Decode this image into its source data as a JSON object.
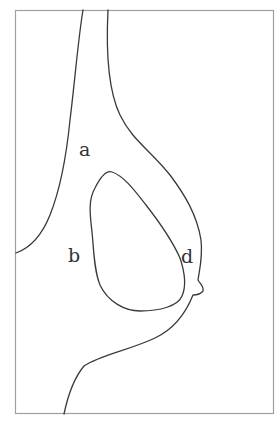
{
  "diagram": {
    "type": "contour-sketch",
    "frame": {
      "x": 15,
      "y": 10,
      "width": 259,
      "height": 404,
      "stroke": "#a0a0a0"
    },
    "line_color": "#3a3a3a",
    "labels": [
      {
        "id": "a",
        "text": "a",
        "x": 79,
        "y": 156
      },
      {
        "id": "b",
        "text": "b",
        "x": 68,
        "y": 262
      },
      {
        "id": "d",
        "text": "d",
        "x": 181,
        "y": 263
      }
    ]
  }
}
